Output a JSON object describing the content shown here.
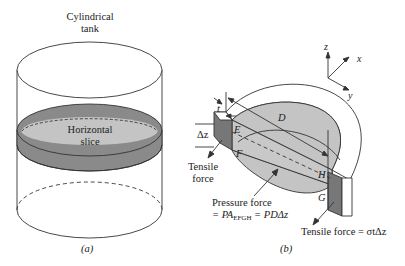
{
  "figure_a": {
    "title_line1": "Cylindrical",
    "title_line2": "tank",
    "slice_line1": "Horizontal",
    "slice_line2": "slice",
    "caption": "(a)"
  },
  "figure_b": {
    "axes": {
      "z": "z",
      "x": "x",
      "y": "y"
    },
    "dim_t": "t",
    "dim_dz": "Δz",
    "dim_D": "D",
    "point_E": "E",
    "point_F": "F",
    "point_G": "G",
    "point_H": "H",
    "tensile_left_line1": "Tensile",
    "tensile_left_line2": "force",
    "pressure_line1": "Pressure force",
    "pressure_line2_prefix": "= PA",
    "pressure_line2_sub": "EFGH",
    "pressure_line2_suffix": " = PDΔz",
    "tensile_right": "Tensile force = σtΔz",
    "caption": "(b)"
  },
  "colors": {
    "slice_rim": "#8a8a8a",
    "slice_face": "#c4c4c4",
    "wall_dark": "#777777",
    "stroke": "#333333"
  }
}
